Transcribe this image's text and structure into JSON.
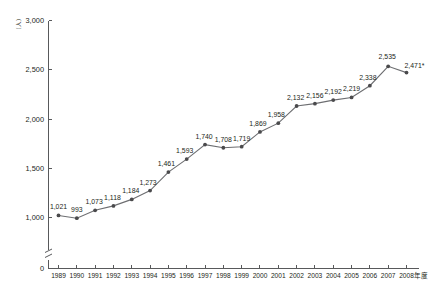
{
  "chart_data": {
    "type": "line",
    "title": "",
    "subtitle": "",
    "xlabel": "年度",
    "ylabel": "（人）",
    "yaxis_unit_label": "（人）",
    "xaxis_unit_label": "年度",
    "categories": [
      "1989",
      "1990",
      "1991",
      "1992",
      "1993",
      "1994",
      "1995",
      "1996",
      "1997",
      "1998",
      "1999",
      "2000",
      "2001",
      "2002",
      "2003",
      "2004",
      "2005",
      "2006",
      "2007",
      "2008"
    ],
    "values": [
      1021,
      993,
      1073,
      1118,
      1184,
      1273,
      1461,
      1593,
      1740,
      1708,
      1719,
      1869,
      1958,
      2132,
      2156,
      2192,
      2219,
      2338,
      2535,
      2471
    ],
    "point_labels": [
      "1,021",
      "993",
      "1,073",
      "1,118",
      "1,184",
      "1,273",
      "1,461",
      "1,593",
      "1,740",
      "1,708",
      "1,719",
      "1,869",
      "1,958",
      "2,132",
      "2,156",
      "2,192",
      "2,219",
      "2,338",
      "2,535",
      "2,471*"
    ],
    "ylim": [
      1000,
      3000
    ],
    "ytick_labels": [
      "3,000",
      "2,500",
      "2,000",
      "1,500",
      "1,000"
    ],
    "ytick_values": [
      3000,
      2500,
      2000,
      1500,
      1000
    ],
    "zero_tick_label": "0",
    "axis_break": true,
    "grid": false,
    "legend": "none",
    "marker": "circle",
    "line_color": "#6d6e71",
    "marker_color": "#4a4a4c",
    "axis_color": "#58595b",
    "footnote_symbol": "*"
  }
}
